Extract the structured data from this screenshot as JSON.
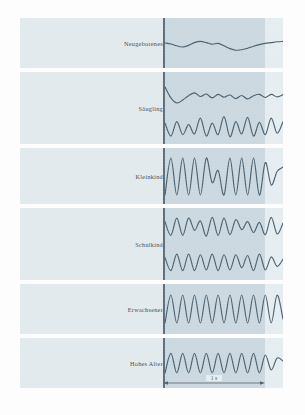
{
  "figure": {
    "scalebar_label": "1 s",
    "colors": {
      "panel_light": "#e2eaee",
      "panel_shade": "#ccd8e0",
      "trace": "#49606f",
      "baseline": "#5b6e7d",
      "page": "#ffffff"
    }
  },
  "chart_data": {
    "type": "line",
    "xlabel": "Zeit",
    "ylabel": "",
    "xlim": [
      0,
      1
    ],
    "ylim": [
      -1,
      1
    ],
    "grid": false,
    "legend_position": "left-labels",
    "annotations": [
      {
        "text": "1 s",
        "kind": "scale-bar",
        "axis": "x",
        "length_seconds": 1
      }
    ],
    "panels": [
      {
        "label": "Neugeborenes",
        "cycles": 1.5,
        "amplitude": 0.22,
        "traces": 1,
        "series": [
          {
            "name": "Neugeborenes",
            "y": [
              0.0,
              -0.05,
              -0.14,
              -0.2,
              -0.12,
              0.02,
              0.08,
              0.02,
              -0.06,
              -0.02,
              -0.14,
              -0.28,
              -0.36,
              -0.34,
              -0.26,
              -0.16,
              -0.08,
              -0.02,
              0.02,
              0.06,
              0.08
            ]
          }
        ]
      },
      {
        "label": "Säugling",
        "cycles": 5,
        "amplitude": 0.45,
        "traces": 2,
        "series": [
          {
            "name": "Säugling oben",
            "y": [
              0.2,
              -0.55,
              -0.9,
              -0.7,
              -0.4,
              -0.2,
              -0.45,
              -0.28,
              -0.55,
              -0.3,
              -0.5,
              -0.35,
              -0.6,
              -0.38,
              -0.62,
              -0.4,
              -0.3,
              -0.52,
              -0.3,
              -0.48,
              -0.32
            ]
          },
          {
            "name": "Säugling unten",
            "y": [
              0.2,
              -0.7,
              0.3,
              -0.6,
              0.1,
              -0.55,
              0.55,
              -0.7,
              0.2,
              -0.6,
              0.65,
              -0.75,
              0.3,
              -0.55,
              0.6,
              -0.7,
              0.25,
              -0.6,
              0.55,
              -0.5,
              0.3
            ]
          }
        ]
      },
      {
        "label": "Kleinkind",
        "cycles": 7,
        "amplitude": 0.8,
        "traces": 1,
        "series": [
          {
            "name": "Kleinkind",
            "y": [
              -0.85,
              0.8,
              -0.85,
              0.8,
              -0.85,
              0.8,
              -0.85,
              0.8,
              -0.3,
              0.25,
              -0.85,
              0.8,
              -0.85,
              0.8,
              -0.85,
              0.8,
              -0.85,
              0.6,
              -0.4,
              0.2,
              0.4
            ]
          }
        ]
      },
      {
        "label": "Schulkind",
        "cycles": 9,
        "amplitude": 0.6,
        "traces": 2,
        "series": [
          {
            "name": "Schulkind oben",
            "y": [
              0.3,
              -0.65,
              0.55,
              -0.65,
              0.55,
              -0.3,
              0.35,
              -0.7,
              0.6,
              -0.65,
              0.55,
              -0.6,
              0.45,
              -0.25,
              0.3,
              -0.45,
              0.25,
              -0.6,
              0.6,
              -0.55,
              0.2
            ]
          },
          {
            "name": "Schulkind unten",
            "y": [
              0.3,
              -0.6,
              0.55,
              -0.6,
              0.55,
              -0.6,
              0.5,
              -0.55,
              0.55,
              -0.6,
              0.5,
              -0.55,
              0.5,
              -0.4,
              0.45,
              -0.6,
              0.55,
              -0.55,
              0.35,
              -0.3,
              0.2
            ]
          }
        ]
      },
      {
        "label": "Erwachsener",
        "cycles": 12,
        "amplitude": 0.7,
        "traces": 1,
        "series": [
          {
            "name": "Erwachsener",
            "y": [
              -0.7,
              0.7,
              -0.7,
              0.7,
              -0.7,
              0.7,
              -0.7,
              0.7,
              -0.7,
              0.7,
              -0.7,
              0.7,
              -0.7,
              0.7,
              -0.7,
              0.7,
              -0.7,
              0.7,
              -0.7,
              0.7,
              -0.5
            ]
          }
        ]
      },
      {
        "label": "Hohes Alter",
        "cycles": 8,
        "amplitude": 0.5,
        "traces": 1,
        "series": [
          {
            "name": "Hohes Alter",
            "y": [
              -0.5,
              0.48,
              -0.5,
              0.48,
              -0.5,
              0.48,
              -0.5,
              0.48,
              -0.5,
              0.48,
              -0.5,
              0.48,
              -0.5,
              0.48,
              -0.5,
              0.48,
              -0.5,
              0.4,
              -0.35,
              0.25,
              0.1
            ]
          }
        ]
      }
    ]
  }
}
